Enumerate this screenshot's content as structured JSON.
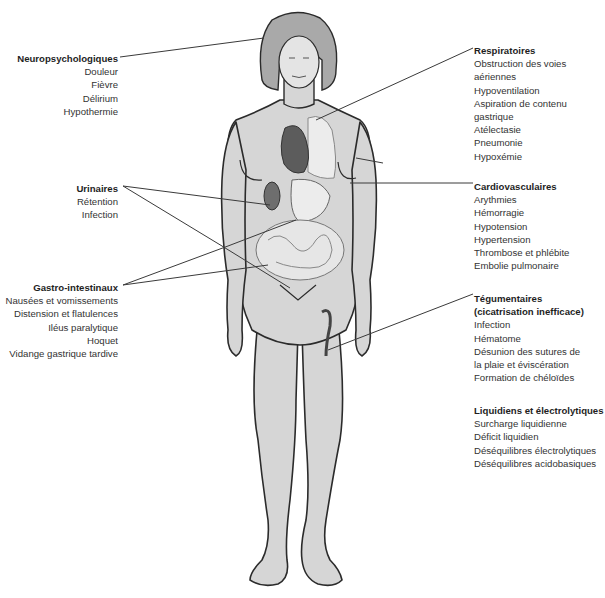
{
  "figure": {
    "colors": {
      "skin": "#d6d6d6",
      "hair": "#a9a9a9",
      "outline": "#2b2b2b",
      "organs_dark": "#6e6e6e",
      "organs_light": "#e8e8e8",
      "leader_line": "#3a3a3a"
    }
  },
  "groups": {
    "neuro": {
      "title": "Neuropsychologiques",
      "items": [
        "Douleur",
        "Fièvre",
        "Délirium",
        "Hypothermie"
      ]
    },
    "urinaires": {
      "title": "Urinaires",
      "items": [
        "Rétention",
        "Infection"
      ]
    },
    "gastro": {
      "title": "Gastro-intestinaux",
      "items": [
        "Nausées et vomissements",
        "Distension et flatulences",
        "Iléus paralytique",
        "Hoquet",
        "Vidange gastrique tardive"
      ]
    },
    "respiratoires": {
      "title": "Respiratoires",
      "items": [
        "Obstruction des voies",
        "aériennes",
        "Hypoventilation",
        "Aspiration de contenu",
        "gastrique",
        "Atélectasie",
        "Pneumonie",
        "Hypoxémie"
      ]
    },
    "cardio": {
      "title": "Cardiovasculaires",
      "items": [
        "Arythmies",
        "Hémorragie",
        "Hypotension",
        "Hypertension",
        "Thrombose et phlébite",
        "Embolie pulmonaire"
      ]
    },
    "tegumentaires": {
      "title": "Tégumentaires",
      "title2": "(cicatrisation inefficace)",
      "items": [
        "Infection",
        "Hématome",
        "Désunion des sutures de",
        "la plaie et éviscération",
        "Formation de chéloïdes"
      ]
    },
    "liquidiens": {
      "title": "Liquidiens et électrolytiques",
      "items": [
        "Surcharge liquidienne",
        "Déficit liquidien",
        "Déséquilibres électrolytiques",
        "Déséquilibres acidobasiques"
      ]
    }
  }
}
